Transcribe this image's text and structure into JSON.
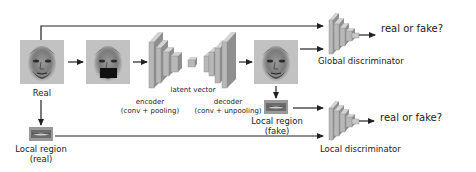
{
  "diagram": {
    "nodes": {
      "real_image": {
        "label": "Real"
      },
      "masked_image": {
        "label": ""
      },
      "encoder": {
        "label_line1": "encoder",
        "label_line2": "(conv + pooling)"
      },
      "latent": {
        "label": "latent vector"
      },
      "decoder": {
        "label_line1": "decoder",
        "label_line2": "(conv + unpooling)"
      },
      "generated_image": {
        "label": ""
      },
      "local_real": {
        "label_line1": "Local region",
        "label_line2": "(real)"
      },
      "local_fake": {
        "label_line1": "Local region",
        "label_line2": "(fake)"
      },
      "global_disc": {
        "label": "Global discriminator",
        "output": "real or fake?"
      },
      "local_disc": {
        "label": "Local discriminator",
        "output": "real or fake?"
      }
    },
    "colors": {
      "block_front": "#b8b8b8",
      "block_side": "#8f8f8f",
      "block_top": "#d4d4d4",
      "arrow": "#222222",
      "face_bg": "#bdbdbd",
      "mask": "#111111"
    }
  }
}
